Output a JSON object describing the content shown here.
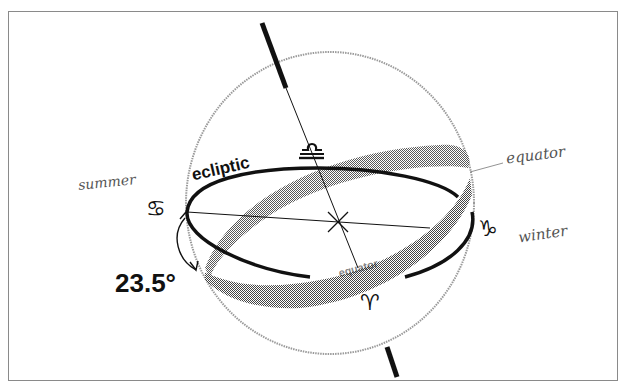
{
  "figure": {
    "labels": {
      "ecliptic": "ecliptic",
      "equator_band": "equator",
      "equator_handwritten": "equator",
      "summer_handwritten": "summer",
      "winter_handwritten": "winter",
      "tilt_angle": "23.5°"
    },
    "zodiac_symbols": {
      "cancer": "♋",
      "capricorn": "♑",
      "libra": "♎",
      "aries": "♈"
    },
    "colors": {
      "ink": "#111111",
      "band": "#6a6a6a",
      "sphere_outline": "#9a9a9a",
      "handwriting": "#555555",
      "frame": "#8a8a8a",
      "background": "#ffffff"
    }
  }
}
